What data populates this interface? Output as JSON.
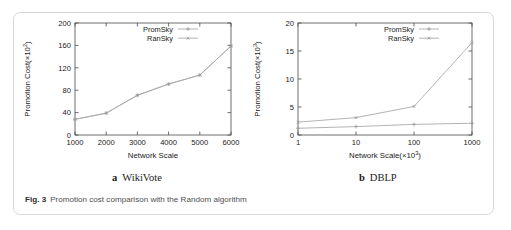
{
  "figure": {
    "number_label": "Fig. 3",
    "caption": "Promotion cost comparison with the Random algorithm",
    "border_color": "#d8d8d8"
  },
  "subcaptions": [
    {
      "letter": "a",
      "text": "WikiVote"
    },
    {
      "letter": "b",
      "text": "DBLP"
    }
  ],
  "legend": {
    "entries": [
      {
        "label": "PromSky",
        "marker": "plus",
        "color": "#a9a9a9"
      },
      {
        "label": "RanSky",
        "marker": "cross",
        "color": "#a9a9a9"
      }
    ]
  },
  "chart_data": [
    {
      "type": "line",
      "panel": "a",
      "title": "WikiVote",
      "xlabel": "Network Scale",
      "ylabel": "Promotion Cost(×10²)",
      "xscale": "linear",
      "xticks": [
        1000,
        2000,
        3000,
        4000,
        5000,
        6000
      ],
      "xticklabels": [
        "1000",
        "2000",
        "3000",
        "4000",
        "5000",
        "6000"
      ],
      "xlim": [
        1000,
        6000
      ],
      "yticks": [
        0,
        40,
        80,
        120,
        160,
        200
      ],
      "yticklabels": [
        "0",
        "40",
        "80",
        "120",
        "160",
        "200"
      ],
      "ylim": [
        0,
        200
      ],
      "grid": false,
      "legend_position": "top-right",
      "x": [
        1000,
        2000,
        3000,
        4000,
        5000,
        6000
      ],
      "series": [
        {
          "name": "PromSky",
          "values": [
            28,
            39,
            71,
            91,
            107,
            159
          ]
        },
        {
          "name": "RanSky",
          "values": [
            28,
            39,
            71,
            91,
            107,
            159
          ]
        }
      ]
    },
    {
      "type": "line",
      "panel": "b",
      "title": "DBLP",
      "xlabel": "Network Scale(×10³)",
      "ylabel": "Promotion Cost(×10³)",
      "xscale": "log",
      "xticks": [
        1,
        10,
        100,
        1000
      ],
      "xticklabels": [
        "1",
        "10",
        "100",
        "1000"
      ],
      "xlim": [
        1,
        1000
      ],
      "yticks": [
        0,
        5,
        10,
        15,
        20
      ],
      "yticklabels": [
        "0",
        "5",
        "10",
        "15",
        "20"
      ],
      "ylim": [
        0,
        20
      ],
      "grid": false,
      "legend_position": "top-right",
      "x": [
        1,
        10,
        100,
        1000
      ],
      "series": [
        {
          "name": "PromSky",
          "values": [
            1.2,
            1.5,
            1.9,
            2.1
          ]
        },
        {
          "name": "RanSky",
          "values": [
            2.3,
            3.1,
            5.1,
            16.5
          ]
        }
      ]
    }
  ]
}
